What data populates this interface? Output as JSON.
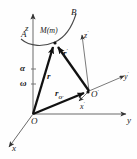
{
  "figure": {
    "kind": "vector-kinematics-diagram",
    "stroke_color": "#1a1a1a",
    "thin_color": "#6b6b6b",
    "background": "#ffffff"
  },
  "labels": {
    "axis_z": "z",
    "axis_y": "y",
    "axis_x": "x",
    "axis_z_prime": "z",
    "axis_y_prime": "y",
    "axis_x_prime": "x",
    "prime_mark": "′",
    "origin_O": "O",
    "origin_O_prime": "O",
    "point_M": "M(m)",
    "curve_start_A": "A",
    "curve_end_B": "B",
    "vector_r": "r",
    "vector_r_prime": "r",
    "vector_r_Oprime_base": "r",
    "vector_r_Oprime_sub": "O′",
    "angular_accel_alpha": "α",
    "angular_vel_omega": "ω"
  },
  "geometry": {
    "origin": [
      33,
      114
    ],
    "o_prime": [
      89,
      91
    ],
    "point_m": [
      55,
      42
    ],
    "z_axis_top": [
      33,
      12
    ],
    "y_axis_end": [
      130,
      114
    ],
    "x_axis_end": [
      6,
      150
    ],
    "z_prime_end": [
      82,
      32
    ],
    "y_prime_end": [
      128,
      73
    ],
    "x_prime_end": [
      81,
      103
    ],
    "alpha_tick_y": 70,
    "omega_tick_y": 85
  }
}
